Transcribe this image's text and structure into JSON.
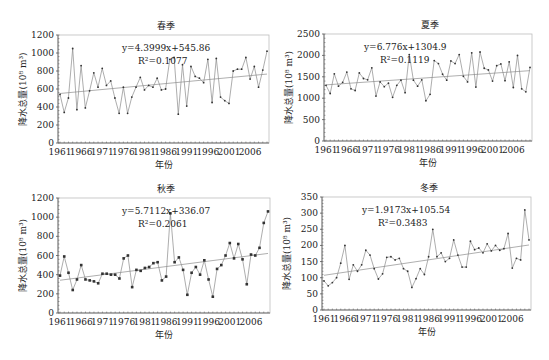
{
  "chart_data": [
    {
      "type": "line",
      "title": "春季",
      "xlabel": "年份",
      "ylabel": "降水总量(10⁸ m³)",
      "ylim": [
        0,
        1200
      ],
      "yticks": [
        0,
        200,
        400,
        600,
        800,
        1000,
        1200
      ],
      "xticks": [
        "1961",
        "1966",
        "1971",
        "1976",
        "1981",
        "1986",
        "1991",
        "1996",
        "2001",
        "2006"
      ],
      "x_start": 1961,
      "x_end": 2010,
      "grid": false,
      "equation": "y=4.3999x+545.86",
      "r2": "R²=0.1077",
      "trend": {
        "slope": 4.3999,
        "intercept": 545.86
      },
      "series": [
        {
          "name": "春季降水总量",
          "values": [
            540,
            340,
            500,
            1050,
            370,
            860,
            390,
            580,
            780,
            620,
            830,
            640,
            690,
            500,
            330,
            620,
            330,
            510,
            620,
            730,
            590,
            640,
            620,
            720,
            590,
            600,
            930,
            950,
            320,
            870,
            410,
            850,
            740,
            720,
            670,
            930,
            450,
            940,
            510,
            470,
            440,
            800,
            820,
            820,
            950,
            710,
            850,
            620,
            810,
            1020
          ]
        }
      ],
      "marker": "small-dot"
    },
    {
      "type": "line",
      "title": "夏季",
      "xlabel": "年份",
      "ylabel": "降水总量(10⁸ m³)",
      "ylim": [
        0,
        2500
      ],
      "yticks": [
        0,
        500,
        1000,
        1500,
        2000,
        2500
      ],
      "xticks": [
        "1961",
        "1966",
        "1971",
        "1976",
        "1981",
        "1986",
        "1991",
        "1996",
        "2001",
        "2006"
      ],
      "x_start": 1961,
      "x_end": 2010,
      "grid": false,
      "equation": "y=6.776x+1304.9",
      "r2": "R²=0.1119",
      "trend": {
        "slope": 6.776,
        "intercept": 1304.9
      },
      "series": [
        {
          "name": "夏季降水总量",
          "values": [
            1300,
            1110,
            1570,
            1280,
            1370,
            1610,
            1220,
            1180,
            1590,
            1460,
            1430,
            1710,
            1050,
            1380,
            1270,
            1350,
            1020,
            1300,
            1420,
            1130,
            2020,
            1420,
            1280,
            1430,
            940,
            1090,
            1880,
            1810,
            1560,
            1420,
            1870,
            1810,
            2020,
            1510,
            1380,
            2060,
            1260,
            2080,
            1700,
            1660,
            1400,
            1760,
            1800,
            1410,
            1850,
            1250,
            2000,
            1220,
            1150,
            1720
          ]
        }
      ],
      "marker": "small-dot"
    },
    {
      "type": "line",
      "title": "秋季",
      "xlabel": "年份",
      "ylabel": "降水总量(10⁸ m³)",
      "ylim": [
        0,
        1200
      ],
      "yticks": [
        0,
        200,
        400,
        600,
        800,
        1000,
        1200
      ],
      "xticks": [
        "1961",
        "1966",
        "1971",
        "1976",
        "1981",
        "1986",
        "1991",
        "1996",
        "2001",
        "2006"
      ],
      "x_start": 1961,
      "x_end": 2010,
      "grid": false,
      "equation": "y=5.7112x+336.07",
      "r2": "R²=0.2061",
      "trend": {
        "slope": 5.7112,
        "intercept": 336.07
      },
      "series": [
        {
          "name": "秋季降水总量",
          "values": [
            390,
            590,
            420,
            240,
            350,
            500,
            350,
            340,
            330,
            310,
            410,
            410,
            400,
            400,
            360,
            570,
            600,
            270,
            450,
            440,
            470,
            480,
            520,
            530,
            340,
            380,
            1040,
            530,
            580,
            450,
            190,
            420,
            480,
            400,
            550,
            350,
            170,
            460,
            500,
            600,
            730,
            570,
            720,
            560,
            300,
            610,
            600,
            680,
            940,
            1060
          ]
        }
      ],
      "marker": "square"
    },
    {
      "type": "line",
      "title": "冬季",
      "xlabel": "年份",
      "ylabel": "降水总量(10⁸ m³)",
      "ylim": [
        0,
        350
      ],
      "yticks": [
        0,
        50,
        100,
        150,
        200,
        250,
        300,
        350
      ],
      "xticks": [
        "1961",
        "1966",
        "1971",
        "1976",
        "1981",
        "1986",
        "1991",
        "1996",
        "2001",
        "2006"
      ],
      "x_start": 1961,
      "x_end": 2010,
      "grid": false,
      "equation": "y=1.9173x+105.54",
      "r2": "R²=0.3483",
      "trend": {
        "slope": 1.9173,
        "intercept": 105.54
      },
      "series": [
        {
          "name": "冬季降水总量",
          "values": [
            90,
            75,
            85,
            100,
            145,
            200,
            95,
            140,
            120,
            140,
            185,
            170,
            128,
            96,
            112,
            163,
            165,
            155,
            160,
            128,
            120,
            70,
            97,
            128,
            110,
            165,
            250,
            165,
            177,
            150,
            160,
            217,
            170,
            133,
            133,
            213,
            187,
            192,
            177,
            205,
            183,
            200,
            185,
            190,
            237,
            130,
            160,
            155,
            310,
            217
          ]
        }
      ],
      "marker": "small-dot"
    }
  ],
  "layout": {
    "panels": [
      {
        "left": 58,
        "top": 35,
        "right": 269,
        "bottom": 143
      },
      {
        "left": 324,
        "top": 34,
        "right": 532,
        "bottom": 141
      },
      {
        "left": 58,
        "top": 198,
        "right": 270,
        "bottom": 313
      },
      {
        "left": 322,
        "top": 197,
        "right": 531,
        "bottom": 310
      }
    ],
    "colors": {
      "line": "#8a8a8a",
      "trend": "#9a9a9a",
      "marker": "#333333",
      "axis": "#555555",
      "frame": "#bdbdbd"
    }
  }
}
